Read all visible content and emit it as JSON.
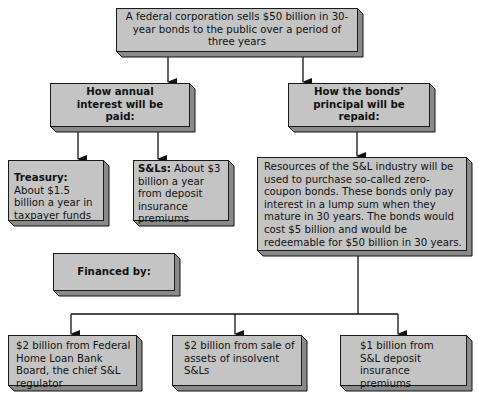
{
  "top": {
    "text": "A federal corporation sells $50 billion in 30-year bonds to the public over a period of three years"
  },
  "interest_header": {
    "text": "How annual interest will be paid:"
  },
  "principal_header": {
    "text": "How the bonds’ principal will be repaid:"
  },
  "treasury": {
    "label": "Treasury:",
    "text": " About $1.5 billion a year in taxpayer funds"
  },
  "sls": {
    "label": "S&Ls:",
    "text": " About $3 billion a year from deposit insurance premiums"
  },
  "resources": {
    "text": "Resources of the S&L industry will be used to purchase so-called zero-coupon bonds. These bonds only pay interest in a lump sum when they mature in 30 years. The bonds would cost $5 billion and would be redeemable for $50 billion in 30 years."
  },
  "financed": {
    "text": "Financed by:"
  },
  "sources": [
    {
      "text": "$2 billion from Federal Home Loan Bank Board, the chief S&L regulator"
    },
    {
      "text": "$2 billion from sale of assets of insolvent S&Ls"
    },
    {
      "text": "$1 billion from S&L deposit insurance premiums"
    }
  ]
}
